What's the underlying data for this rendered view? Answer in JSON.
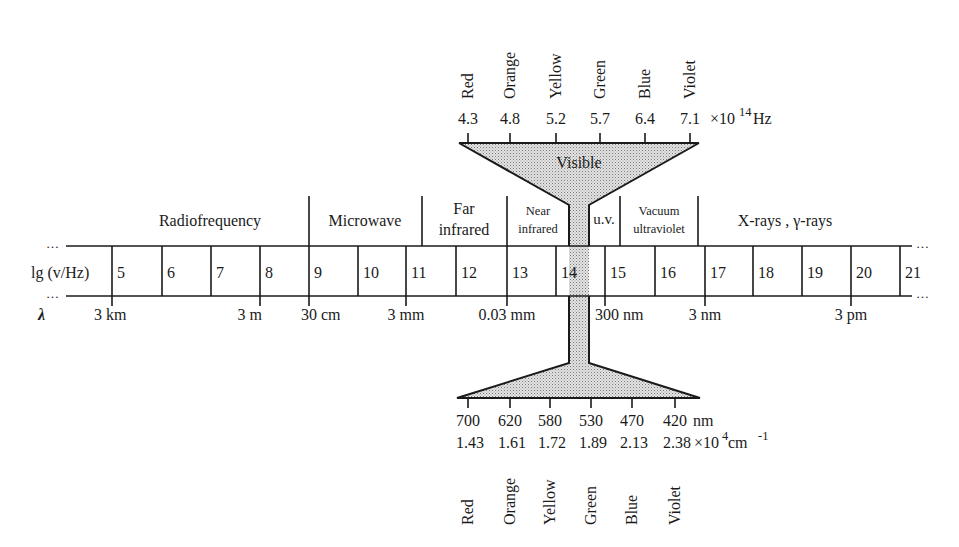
{
  "colors": {
    "ink": "#1a1a1a",
    "fill_stipple": "#c8c8c8",
    "background": "#ffffff"
  },
  "scale": {
    "row_label": "lg (v/Hz)",
    "ellipsis": "…",
    "values": [
      "5",
      "6",
      "7",
      "8",
      "9",
      "10",
      "11",
      "12",
      "13",
      "14",
      "15",
      "16",
      "17",
      "18",
      "19",
      "20",
      "21"
    ],
    "boundaries_x": [
      112,
      162,
      211,
      260,
      309,
      358,
      406,
      456,
      507,
      556,
      605,
      655,
      705,
      753,
      802,
      851,
      900
    ]
  },
  "regions": [
    {
      "label": "Radiofrequency",
      "lines": [
        "Radiofrequency"
      ],
      "x_center": 210,
      "size": "large"
    },
    {
      "label": "Microwave",
      "lines": [
        "Microwave"
      ],
      "x_center": 365,
      "size": "large"
    },
    {
      "label": "Far infrared",
      "lines": [
        "Far",
        "infrared"
      ],
      "x_center": 464,
      "size": "large"
    },
    {
      "label": "Near infrared",
      "lines": [
        "Near",
        "infrared"
      ],
      "x_center": 538,
      "size": "small"
    },
    {
      "label": "u.v.",
      "lines": [
        "u.v."
      ],
      "x_center": 604,
      "size": "medium"
    },
    {
      "label": "Vacuum ultraviolet",
      "lines": [
        "Vacuum",
        "ultraviolet"
      ],
      "x_center": 659,
      "size": "small"
    },
    {
      "label": "X-rays , γ-rays",
      "lines": [
        "X-rays , γ-rays"
      ],
      "x_center": 785,
      "size": "large"
    }
  ],
  "region_dividers_x": [
    309,
    422,
    507,
    620,
    698
  ],
  "wavelength": {
    "symbol": "λ",
    "marks": [
      {
        "label": "3 km",
        "x": 112
      },
      {
        "label": "3 m",
        "x": 260
      },
      {
        "label": "30 cm",
        "x": 309
      },
      {
        "label": "3 mm",
        "x": 406
      },
      {
        "label": "0.03 mm",
        "x": 507
      },
      {
        "label": "300 nm",
        "x": 605
      },
      {
        "label": "3 nm",
        "x": 705
      },
      {
        "label": "3 pm",
        "x": 851
      }
    ]
  },
  "visible": {
    "label": "Visible",
    "colors": [
      "Red",
      "Orange",
      "Yellow",
      "Green",
      "Blue",
      "Violet"
    ],
    "frequency_values": [
      "4.3",
      "4.8",
      "5.2",
      "5.7",
      "6.4",
      "7.1"
    ],
    "frequency_unit": "×10",
    "frequency_exp": "14",
    "frequency_hz": " Hz",
    "wavelength_nm": [
      "700",
      "620",
      "580",
      "530",
      "470",
      "420"
    ],
    "wavelength_unit": "nm",
    "wavenumber_values": [
      "1.43",
      "1.61",
      "1.72",
      "1.89",
      "2.13",
      "2.38"
    ],
    "wavenumber_unit": "×10",
    "wavenumber_exp": "4",
    "wavenumber_cm": " cm",
    "wavenumber_cm_exp": "-1",
    "top_ticks_x": [
      468,
      510,
      556,
      600,
      645,
      690
    ],
    "bottom_ticks_x": [
      468,
      510,
      550,
      591,
      632,
      675
    ]
  }
}
